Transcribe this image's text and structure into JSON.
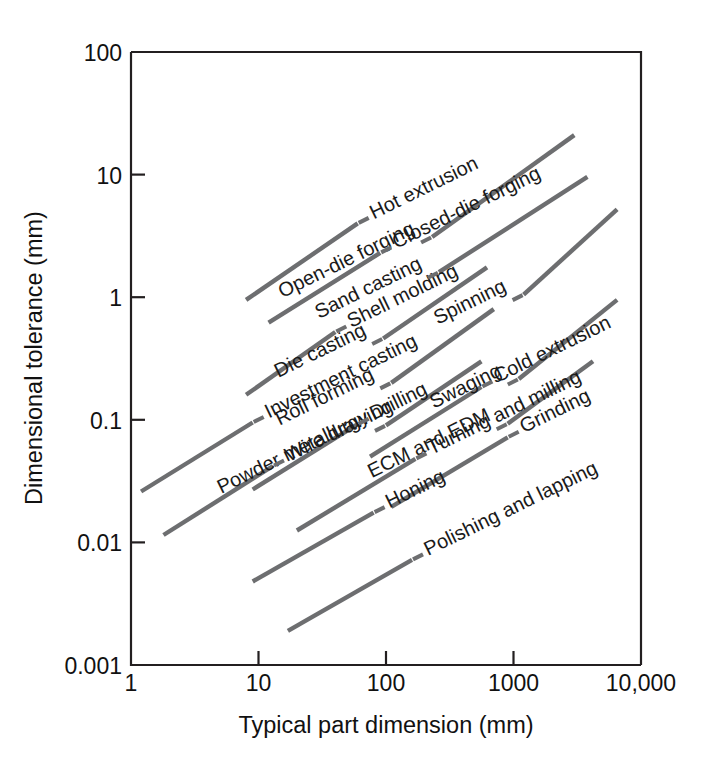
{
  "chart_data": {
    "type": "line",
    "title": "",
    "xlabel": "Typical part dimension (mm)",
    "ylabel": "Dimensional tolerance (mm)",
    "xscale": "log",
    "yscale": "log",
    "xlim": [
      1,
      10000
    ],
    "ylim": [
      0.001,
      100
    ],
    "xticks": [
      "1",
      "10",
      "100",
      "1000",
      "10,000"
    ],
    "xtick_values": [
      1,
      10,
      100,
      1000,
      10000
    ],
    "yticks": [
      "100",
      "10",
      "1",
      "0.1",
      "0.01",
      "0.001"
    ],
    "ytick_values": [
      100,
      10,
      1,
      0.1,
      0.01,
      0.001
    ],
    "grid": false,
    "legend": "inline-labels",
    "line_color": "#6d6e70",
    "axis_color": "#231f20",
    "series": [
      {
        "name": "Hot extrusion",
        "label": "Hot extrusion",
        "x": [
          8,
          60
        ],
        "y": [
          0.95,
          4.0
        ]
      },
      {
        "name": "Open-die forging",
        "label": "Open-die forging",
        "x": [
          230,
          3000
        ],
        "y": [
          3.1,
          21.0
        ]
      },
      {
        "name": "Closed-die forging",
        "label": "Closed-die forging",
        "x": [
          12,
          90
        ],
        "y": [
          0.62,
          2.3
        ]
      },
      {
        "name": "Sand casting",
        "label": "Sand casting",
        "x": [
          260,
          3800
        ],
        "y": [
          1.6,
          9.6
        ]
      },
      {
        "name": "Shell molding",
        "label": "Shell molding",
        "x": [
          8,
          40
        ],
        "y": [
          0.16,
          0.52
        ]
      },
      {
        "name": "Die casting",
        "label": "Die casting",
        "x": [
          95,
          620
        ],
        "y": [
          0.46,
          1.75
        ]
      },
      {
        "name": "Spinning",
        "label": "Spinning",
        "x": [
          1200,
          6500
        ],
        "y": [
          1.05,
          5.2
        ]
      },
      {
        "name": "Roll forming",
        "label": "Roll forming",
        "x": [
          110,
          700
        ],
        "y": [
          0.2,
          0.8
        ]
      },
      {
        "name": "Investment casting",
        "label": "Investment casting",
        "x": [
          1.2,
          9
        ],
        "y": [
          0.026,
          0.095
        ]
      },
      {
        "name": "Powder metallurgy",
        "label": "Powder metallurgy",
        "x": [
          100,
          560
        ],
        "y": [
          0.09,
          0.3
        ]
      },
      {
        "name": "Swaging",
        "label": "Swaging",
        "x": [
          1100,
          6500
        ],
        "y": [
          0.215,
          0.95
        ]
      },
      {
        "name": "Wire drawing",
        "label": "Wire drawing",
        "x": [
          1.8,
          13
        ],
        "y": [
          0.0115,
          0.042
        ]
      },
      {
        "name": "Drilling",
        "label": "Drilling",
        "x": [
          9,
          60
        ],
        "y": [
          0.027,
          0.092
        ]
      },
      {
        "name": "Cold extrusion",
        "label": "Cold extrusion",
        "x": [
          75,
          560
        ],
        "y": [
          0.05,
          0.185
        ]
      },
      {
        "name": "ECM and EDM",
        "label": "ECM and EDM",
        "x": [
          900,
          4200
        ],
        "y": [
          0.093,
          0.3
        ]
      },
      {
        "name": "Turning and milling",
        "label": "Turning and milling",
        "x": [
          20,
          170
        ],
        "y": [
          0.0125,
          0.048
        ]
      },
      {
        "name": "Grinding",
        "label": "Grinding",
        "x": [
          110,
          900
        ],
        "y": [
          0.0195,
          0.072
        ]
      },
      {
        "name": "Honing",
        "label": "Honing",
        "x": [
          9,
          80
        ],
        "y": [
          0.0048,
          0.0175
        ]
      },
      {
        "name": "Polishing and lapping",
        "label": "Polishing and lapping",
        "x": [
          17,
          160
        ],
        "y": [
          0.0019,
          0.0072
        ]
      }
    ]
  }
}
